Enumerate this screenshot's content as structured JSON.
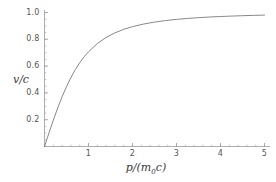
{
  "chart_data": {
    "type": "line",
    "title": "",
    "subtitle": "",
    "xlabel": "p/(m0c)",
    "xlabel_base": "p/(m",
    "xlabel_sub": "0",
    "xlabel_tail": "c)",
    "ylabel": "v/c",
    "xlim": [
      0,
      5.15
    ],
    "ylim": [
      0,
      1.04
    ],
    "grid": false,
    "legend": null,
    "line_color": "#7a7a7a",
    "axis_color": "#9a9a9a",
    "background": "#ffffff",
    "xticks": [
      1,
      2,
      3,
      4,
      5
    ],
    "xtick_labels": [
      "1",
      "2",
      "3",
      "4",
      "5"
    ],
    "x_minor_tick_step": 0.2,
    "yticks": [
      0.2,
      0.4,
      0.6,
      0.8,
      1.0
    ],
    "ytick_labels": [
      "0.2",
      "0.4",
      "0.6",
      "0.8",
      "1.0"
    ],
    "y_minor_tick_step": 0.05,
    "series": [
      {
        "name": "v/c = p / sqrt(1 + p^2)",
        "x": [
          0,
          0.1,
          0.2,
          0.3,
          0.4,
          0.5,
          0.6,
          0.7,
          0.8,
          0.9,
          1.0,
          1.2,
          1.4,
          1.6,
          1.8,
          2.0,
          2.25,
          2.5,
          2.75,
          3.0,
          3.25,
          3.5,
          3.75,
          4.0,
          4.25,
          4.5,
          4.75,
          5.0
        ],
        "values": [
          0.0,
          0.0995,
          0.1961,
          0.2873,
          0.3714,
          0.4472,
          0.5145,
          0.5735,
          0.6247,
          0.669,
          0.7071,
          0.7682,
          0.8137,
          0.848,
          0.8742,
          0.8944,
          0.9138,
          0.9285,
          0.9398,
          0.9487,
          0.9558,
          0.9615,
          0.9662,
          0.9701,
          0.9733,
          0.9762,
          0.9786,
          0.9806
        ]
      }
    ]
  }
}
